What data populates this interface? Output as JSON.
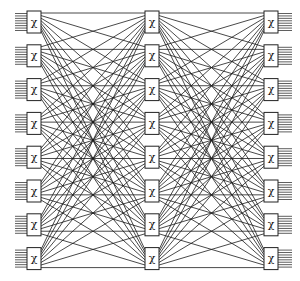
{
  "diagram": {
    "type": "three-stage switching network",
    "stages": [
      {
        "name": "input-stage",
        "switch_count": 8,
        "switch_symbol": "χ"
      },
      {
        "name": "middle-stage",
        "switch_count": 8,
        "switch_symbol": "χ"
      },
      {
        "name": "output-stage",
        "switch_count": 8,
        "switch_symbol": "χ"
      }
    ],
    "ports_per_switch": 8,
    "interconnect": "full bipartite between adjacent stages",
    "colors": {
      "line": "#1a1a1a",
      "box_fill": "#ffffff",
      "box_stroke": "#222222",
      "background": "#ffffff"
    }
  }
}
